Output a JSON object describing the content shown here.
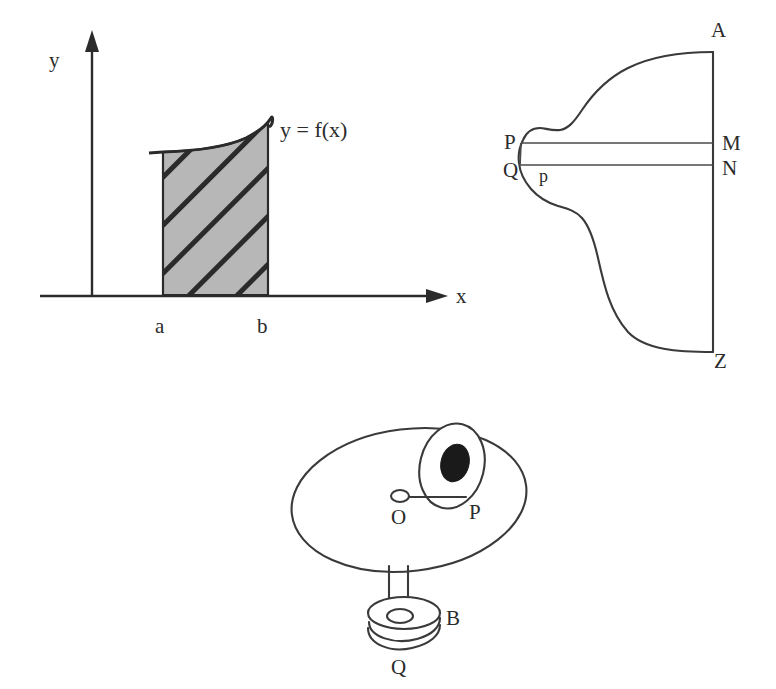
{
  "page": {
    "background_color": "#ffffff",
    "ink_color": "#2b2b2b",
    "width": 776,
    "height": 689
  },
  "figures": [
    {
      "id": "integral-area-figure",
      "name": "Definite integral shaded area under curve",
      "axes": {
        "y_axis_label": "y",
        "x_axis_label": "x",
        "y_axis_arrow": "arrow-up",
        "x_axis_arrow": "arrow-right"
      },
      "curve_label": "y = f(x)",
      "bounds": {
        "lower_limit_label": "a",
        "upper_limit_label": "b"
      },
      "region": {
        "fill_style": "diagonal-hatch",
        "fill_color": "#b5b5b5",
        "hatch_color": "#2b2b2b"
      }
    },
    {
      "id": "strip-cross-section-figure",
      "name": "Irregular lamina with horizontal strip PQNM",
      "labels": {
        "top_vertex": "A",
        "bottom_vertex": "Z",
        "left_upper": "P",
        "left_lower": "Q",
        "right_upper": "M",
        "right_lower": "N",
        "strip_point": "p"
      }
    },
    {
      "id": "bob-and-disc-figure",
      "name": "Rotating disc with pivot O, point P and suspended bob B at Q",
      "labels": {
        "center": "O",
        "peg": "P",
        "disc": "B",
        "bob": "Q"
      }
    }
  ]
}
